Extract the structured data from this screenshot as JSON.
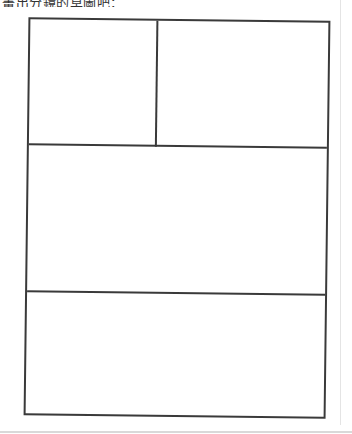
{
  "instruction": {
    "text": "畫出分鏡的草圖吧："
  },
  "storyboard": {
    "panels": [
      {
        "id": "panel-1",
        "row": 1,
        "position": "top-left",
        "content": ""
      },
      {
        "id": "panel-2",
        "row": 1,
        "position": "top-right",
        "content": ""
      },
      {
        "id": "panel-3",
        "row": 2,
        "position": "middle",
        "content": ""
      },
      {
        "id": "panel-4",
        "row": 3,
        "position": "bottom",
        "content": ""
      }
    ],
    "line_color": "#3a3a3a",
    "background": "#ffffff"
  }
}
